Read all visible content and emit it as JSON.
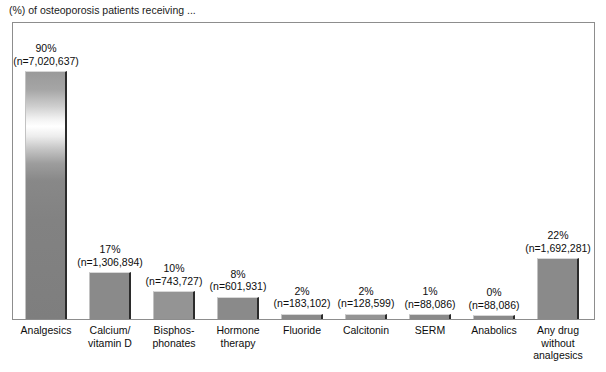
{
  "chart_data": {
    "type": "bar",
    "title": "(%) of osteoporosis patients receiving ...",
    "xlabel": "",
    "ylabel": "",
    "ylim": [
      0,
      100
    ],
    "grid": false,
    "legend": "none",
    "categories": [
      "Analgesics",
      "Calcium/ vitamin D",
      "Bisphos- phonates",
      "Hormone therapy",
      "Fluoride",
      "Calcitonin",
      "SERM",
      "Anabolics",
      "Any drug without analgesics"
    ],
    "values": [
      90,
      17,
      10,
      8,
      2,
      2,
      1,
      0,
      22
    ],
    "counts": [
      7020637,
      1306894,
      743727,
      601931,
      183102,
      128599,
      88086,
      88086,
      1692281
    ]
  },
  "chart": {
    "title": "(%) of osteoporosis patients receiving ...",
    "bars": [
      {
        "id": "analgesics",
        "pct": "90%",
        "n": "(n=7,020,637)",
        "cat_lines": [
          "Analgesics"
        ]
      },
      {
        "id": "calcium-vitamin-d",
        "pct": "17%",
        "n": "(n=1,306,894)",
        "cat_lines": [
          "Calcium/",
          "vitamin D"
        ]
      },
      {
        "id": "bisphosphonates",
        "pct": "10%",
        "n": "(n=743,727)",
        "cat_lines": [
          "Bisphos-",
          "phonates"
        ]
      },
      {
        "id": "hormone-therapy",
        "pct": "8%",
        "n": "(n=601,931)",
        "cat_lines": [
          "Hormone",
          "therapy"
        ]
      },
      {
        "id": "fluoride",
        "pct": "2%",
        "n": "(n=183,102)",
        "cat_lines": [
          "Fluoride"
        ]
      },
      {
        "id": "calcitonin",
        "pct": "2%",
        "n": "(n=128,599)",
        "cat_lines": [
          "Calcitonin"
        ]
      },
      {
        "id": "serm",
        "pct": "1%",
        "n": "(n=88,086)",
        "cat_lines": [
          "SERM"
        ]
      },
      {
        "id": "anabolics",
        "pct": "0%",
        "n": "(n=88,086)",
        "cat_lines": [
          "Anabolics"
        ]
      },
      {
        "id": "any-drug-without-analgesics",
        "pct": "22%",
        "n": "(n=1,692,281)",
        "cat_lines": [
          "Any drug",
          "without",
          "analgesics"
        ]
      }
    ],
    "colors": {
      "bar_fill": "#7f7f7f",
      "bar_shadow": "#2b2b2b",
      "bar_highlight": "#d8d8d8",
      "frame": "#8d8d8d",
      "background": "#ffffff",
      "text": "#0d0d0d"
    }
  }
}
